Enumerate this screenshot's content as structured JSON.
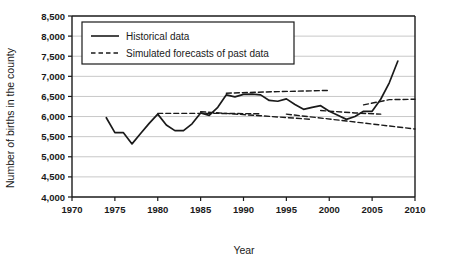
{
  "chart_data": {
    "type": "line",
    "title": "",
    "xlabel": "Year",
    "ylabel": "Number of births in the county",
    "xlim": [
      1970,
      2010
    ],
    "ylim": [
      4000,
      8500
    ],
    "xticks": [
      1970,
      1975,
      1980,
      1985,
      1990,
      1995,
      2000,
      2005,
      2010
    ],
    "xtick_labels": [
      "1970",
      "1975",
      "1980",
      "1985",
      "1990",
      "1995",
      "2000",
      "2005",
      "2010"
    ],
    "yticks": [
      4000,
      4500,
      5000,
      5500,
      6000,
      6500,
      7000,
      7500,
      8000,
      8500
    ],
    "ytick_labels": [
      "4,000",
      "4,500",
      "5,000",
      "5,500",
      "6,000",
      "6,500",
      "7,000",
      "7,500",
      "8,000",
      "8,500"
    ],
    "grid": true,
    "grid_axis": "y",
    "legend_position": "upper-left",
    "legend": [
      {
        "label": "Historical data",
        "style": "solid"
      },
      {
        "label": "Simulated forecasts of past data",
        "style": "dashed"
      }
    ],
    "series": [
      {
        "name": "Historical data",
        "style": "solid",
        "color": "#1a1a1a",
        "x": [
          1974,
          1975,
          1976,
          1977,
          1978,
          1979,
          1980,
          1981,
          1982,
          1983,
          1984,
          1985,
          1986,
          1987,
          1988,
          1989,
          1990,
          1991,
          1992,
          1993,
          1994,
          1995,
          1996,
          1997,
          1998,
          1999,
          2000,
          2001,
          2002,
          2003,
          2004,
          2005,
          2006,
          2007,
          2008
        ],
        "values": [
          5970,
          5600,
          5600,
          5320,
          5580,
          5830,
          6060,
          5790,
          5650,
          5650,
          5820,
          6090,
          6030,
          6230,
          6540,
          6490,
          6550,
          6560,
          6540,
          6400,
          6380,
          6440,
          6300,
          6180,
          6230,
          6270,
          6130,
          6030,
          5930,
          6000,
          6130,
          6130,
          6430,
          6840,
          7380
        ]
      },
      {
        "name": "Simulated forecast from 1980",
        "style": "dashed",
        "color": "#1a1a1a",
        "x": [
          1980,
          1986,
          1992
        ],
        "values": [
          6080,
          6080,
          6070
        ]
      },
      {
        "name": "Simulated forecast from 1985",
        "style": "dashed",
        "color": "#1a1a1a",
        "x": [
          1985,
          1992,
          1998
        ],
        "values": [
          6120,
          6020,
          5930
        ]
      },
      {
        "name": "Simulated forecast from 1988",
        "style": "dashed",
        "color": "#1a1a1a",
        "x": [
          1988,
          1994,
          2000
        ],
        "values": [
          6580,
          6620,
          6650
        ]
      },
      {
        "name": "Simulated forecast from 1995",
        "style": "dashed",
        "color": "#1a1a1a",
        "x": [
          1995,
          2002,
          2010
        ],
        "values": [
          6060,
          5890,
          5690
        ]
      },
      {
        "name": "Simulated forecast from 1999",
        "style": "dashed",
        "color": "#1a1a1a",
        "x": [
          1999,
          2003,
          2006
        ],
        "values": [
          6150,
          6090,
          6060
        ]
      },
      {
        "name": "Simulated forecast from 2004",
        "style": "dashed",
        "color": "#1a1a1a",
        "x": [
          2004,
          2007,
          2010
        ],
        "values": [
          6290,
          6420,
          6430
        ]
      }
    ]
  }
}
